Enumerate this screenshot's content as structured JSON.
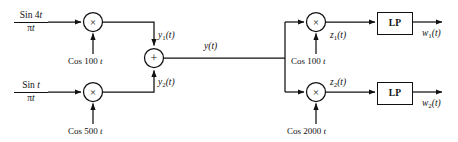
{
  "diagram": {
    "stroke_color": "#111111",
    "background_color": "#ffffff",
    "inputs": [
      {
        "id": "input-top",
        "numerator": "Sin 4t",
        "denominator": "πt",
        "numerator_base": "Sin 4",
        "numerator_italic": "t",
        "denominator_base": "π",
        "denominator_italic": "t"
      },
      {
        "id": "input-bottom",
        "numerator": "Sin t",
        "denominator": "πt",
        "numerator_base": "Sin ",
        "numerator_italic": "t",
        "denominator_base": "π",
        "denominator_italic": "t"
      }
    ],
    "multipliers": [
      {
        "id": "mult-1",
        "symbol": "×",
        "carrier": "Cos 100",
        "carrier_var": "t"
      },
      {
        "id": "mult-2",
        "symbol": "×",
        "carrier": "Cos 500",
        "carrier_var": "t"
      },
      {
        "id": "mult-3",
        "symbol": "×",
        "carrier": "Cos 100",
        "carrier_var": "t"
      },
      {
        "id": "mult-4",
        "symbol": "×",
        "carrier": "Cos 2000",
        "carrier_var": "t"
      }
    ],
    "adder": {
      "id": "summer",
      "symbol": "+"
    },
    "filters": [
      {
        "id": "lp-top",
        "label": "LP"
      },
      {
        "id": "lp-bottom",
        "label": "LP"
      }
    ],
    "signals": {
      "y1": {
        "base": "y",
        "sub": "1",
        "arg": "(t)"
      },
      "y2": {
        "base": "y",
        "sub": "2",
        "arg": "(t)"
      },
      "y": {
        "base": "y",
        "sub": "",
        "arg": "(t)"
      },
      "z1": {
        "base": "z",
        "sub": "1",
        "arg": "(t)"
      },
      "z2": {
        "base": "z",
        "sub": "2",
        "arg": "(t)"
      },
      "w1": {
        "base": "w",
        "sub": "1",
        "arg": "(t)"
      },
      "w2": {
        "base": "w",
        "sub": "2",
        "arg": "(t)"
      }
    }
  }
}
